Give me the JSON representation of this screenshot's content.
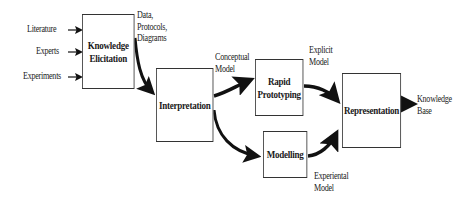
{
  "diagram": {
    "inputs": [
      {
        "label": "Literature"
      },
      {
        "label": "Experts"
      },
      {
        "label": "Experiments"
      }
    ],
    "nodes": {
      "elicitation": {
        "line1": "Knowledge",
        "line2": "Elicitation"
      },
      "interpretation": {
        "label": "Interpretation"
      },
      "prototyping": {
        "line1": "Rapid",
        "line2": "Prototyping"
      },
      "modelling": {
        "label": "Modelling"
      },
      "representation": {
        "label": "Representation"
      }
    },
    "edge_labels": {
      "data": {
        "line1": "Data,",
        "line2": "Protocols,",
        "line3": "Diagrams"
      },
      "conceptual": {
        "line1": "Conceptual",
        "line2": "Model"
      },
      "explicit": {
        "line1": "Explicit",
        "line2": "Model"
      },
      "experiental": {
        "line1": "Experiental",
        "line2": "Model"
      },
      "output": {
        "line1": "Knowledge",
        "line2": "Base"
      }
    },
    "colors": {
      "stroke": "#111111",
      "box_border": "#333333",
      "background": "#ffffff"
    }
  }
}
